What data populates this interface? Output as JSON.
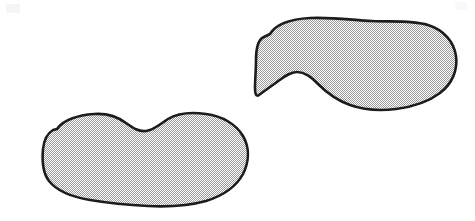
{
  "figure": {
    "title": "Two shaded footprint outlines",
    "background_color": "#ffffff",
    "width": 475,
    "height": 221,
    "fill_color": "#b9b9b9",
    "fill_pattern": "halftone-checkerboard-dither",
    "fill_pattern_light": "#ffffff",
    "fill_pattern_dark": "#9a9a9a",
    "outline_color": "#1c1c1c",
    "outline_width": 2.6
  },
  "shapes": [
    {
      "id": "footprint-upper-right",
      "label": "Upper right footprint",
      "position": "upper-right",
      "bbox": {
        "x": 255,
        "y": 17,
        "width": 202,
        "height": 96
      },
      "orientation": "heel-left-toe-right",
      "features": [
        "rounded heel lobe",
        "concave arch notch on lower edge",
        "broad rounded forefoot",
        "flattened left tip"
      ],
      "path": "M 270 34 C 276 24, 292 19, 310 18 C 332 17, 352 20, 372 21 C 392 22, 412 20, 428 25 C 444 30, 454 42, 456 56 C 458 70, 452 84, 440 93 C 428 102, 412 107, 396 109 C 380 111, 364 110, 350 105 C 336 100, 326 92, 318 84 C 311 77, 305 72, 297 72 C 290 72, 284 77, 277 82 C 270 87, 263 92, 259 95 C 256 97, 255 94, 255 88 C 255 80, 256 70, 256 60 C 256 50, 257 42, 262 38 Z"
    },
    {
      "id": "footprint-lower-left",
      "label": "Lower left footprint",
      "position": "lower-left",
      "bbox": {
        "x": 42,
        "y": 112,
        "width": 206,
        "height": 96
      },
      "orientation": "heel-left-toe-right",
      "features": [
        "rounded heel lobe",
        "concave arch notch on upper edge",
        "broad rounded forefoot",
        "flattened left tip"
      ],
      "path": "M 57 129 C 63 120, 78 115, 94 114 C 108 113, 118 117, 126 123 C 133 128, 139 132, 146 131 C 154 130, 160 124, 168 119 C 178 113, 192 112, 206 114 C 222 116, 236 124, 243 136 C 250 148, 249 162, 243 174 C 236 187, 222 196, 206 201 C 188 206, 168 207, 148 206 C 128 205, 108 203, 90 200 C 72 197, 57 191, 49 181 C 42 172, 42 160, 43 149 C 44 140, 48 133, 53 130 Z"
    }
  ]
}
